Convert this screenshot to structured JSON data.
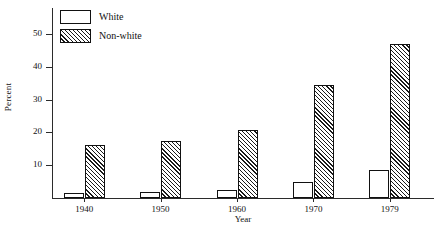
{
  "chart_data": {
    "type": "bar",
    "title": "",
    "subtitle": "",
    "xlabel": "Year",
    "ylabel": "Percent",
    "categories": [
      "1940",
      "1950",
      "1960",
      "1970",
      "1979"
    ],
    "series": [
      {
        "name": "White",
        "values": [
          1.6,
          1.8,
          2.4,
          5.0,
          8.7
        ],
        "fill": "none",
        "edge_color": "#111111"
      },
      {
        "name": "Non-white",
        "values": [
          16.3,
          17.5,
          20.7,
          34.6,
          47.1
        ],
        "fill": "diagonal-hatch",
        "edge_color": "#111111"
      }
    ],
    "yticks": [
      10,
      20,
      30,
      40,
      50
    ],
    "ylim": [
      0,
      58
    ],
    "xlim": [
      0,
      5
    ],
    "grid": false,
    "legend_position": "top-left",
    "legend_entries": [
      "White",
      "Non-white"
    ]
  },
  "axes": {
    "ylabel": "Percent",
    "xlabel": "Year",
    "ytick_labels": [
      "10",
      "20",
      "30",
      "40",
      "50"
    ],
    "xtick_labels": [
      "1940",
      "1950",
      "1960",
      "1970",
      "1979"
    ]
  },
  "legend": {
    "items": [
      {
        "label": "White",
        "swatch": "empty-box-swatch"
      },
      {
        "label": "Non-white",
        "swatch": "hatched-box-swatch"
      }
    ]
  },
  "colors": {
    "axis": "#2b2b2b",
    "bar_edge": "#111111",
    "bar_fill_white": "#ffffff",
    "hatch": "#1a1a1a",
    "background": "#ffffff"
  }
}
